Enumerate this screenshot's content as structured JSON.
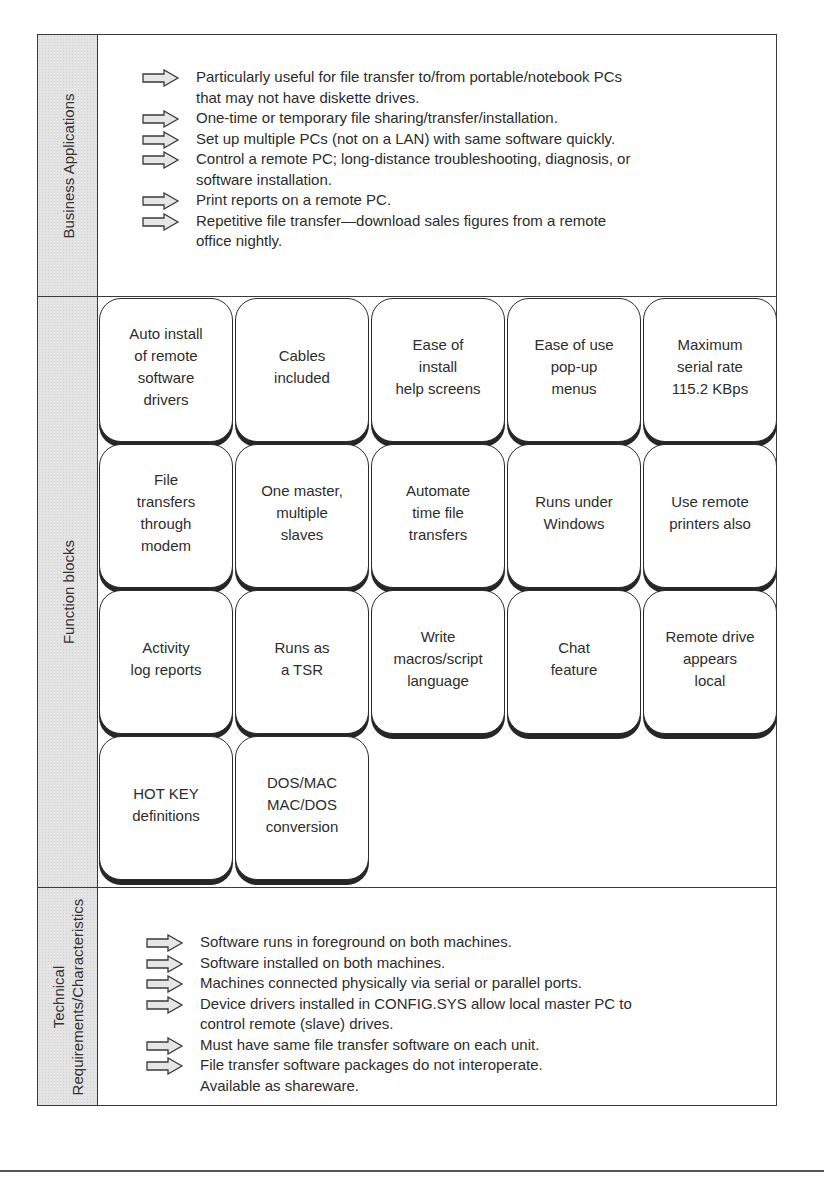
{
  "figure": {
    "sections": {
      "business": {
        "label": "Business Applications",
        "items": [
          {
            "text": "Particularly useful for file transfer to/from portable/notebook PCs\nthat may not have diskette drives.",
            "arrow": true
          },
          {
            "text": "One-time or temporary file sharing/transfer/installation.",
            "arrow": true
          },
          {
            "text": "Set up multiple PCs (not on a LAN) with same software quickly.",
            "arrow": true
          },
          {
            "text": "Control a remote PC; long-distance troubleshooting, diagnosis, or\nsoftware installation.",
            "arrow": true
          },
          {
            "text": "Print reports on a remote PC.",
            "arrow": true
          },
          {
            "text": "Repetitive file transfer—download sales figures from a remote\noffice nightly.",
            "arrow": true
          }
        ]
      },
      "function_blocks": {
        "label": "Function blocks",
        "rows": [
          [
            "Auto install\nof remote\nsoftware\ndrivers",
            "Cables\nincluded",
            "Ease of\ninstall\nhelp screens",
            "Ease of use\npop-up\nmenus",
            "Maximum\nserial rate\n115.2 KBps"
          ],
          [
            "File\ntransfers\nthrough\nmodem",
            "One master,\nmultiple\nslaves",
            "Automate\ntime file\ntransfers",
            "Runs under\nWindows",
            "Use remote\nprinters also"
          ],
          [
            "Activity\nlog reports",
            "Runs as\na TSR",
            "Write\nmacros/script\nlanguage",
            "Chat\nfeature",
            "Remote drive\nappears\nlocal"
          ],
          [
            "HOT KEY\ndefinitions",
            "DOS/MAC\nMAC/DOS\nconversion"
          ]
        ]
      },
      "technical": {
        "label_line1": "Technical",
        "label_line2": "Requirements/Characteristics",
        "items": [
          {
            "text": "Software runs in foreground on both machines.",
            "arrow": true
          },
          {
            "text": "Software installed on both machines.",
            "arrow": true
          },
          {
            "text": "Machines connected physically via serial or parallel ports.",
            "arrow": true
          },
          {
            "text": "Device drivers installed in CONFIG.SYS allow local master PC to\ncontrol remote (slave) drives.",
            "arrow": true
          },
          {
            "text": "Must have same file transfer software on each unit.",
            "arrow": true
          },
          {
            "text": "File transfer software packages do not interoperate.",
            "arrow": true
          },
          {
            "text": "Available as shareware.",
            "arrow": false
          }
        ]
      }
    }
  },
  "colors": {
    "label_fill": "#e4e4e4",
    "border": "#3a3a3a",
    "arrow_fill": "#e6e6e6",
    "text": "#2c2c2c"
  }
}
